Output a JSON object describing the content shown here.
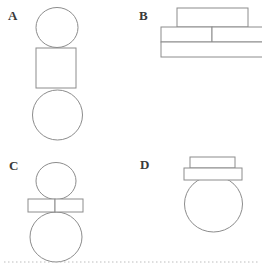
{
  "figure": {
    "background_color": "#ffffff",
    "stroke_color": "#8c8c8c",
    "fill_color": "#ffffff",
    "label_color": "#3a3a3a",
    "baseline_color": "#bdbdbd",
    "width": 262,
    "height": 267
  },
  "panels": [
    {
      "id": "panel-a",
      "label": "A",
      "label_x": 8,
      "label_y": 9,
      "description": "small circle above a square above a large circle",
      "shapes": [
        {
          "name": "small-circle",
          "type": "ellipse",
          "cx": 57,
          "cy": 27.5,
          "rx": 21,
          "ry": 20
        },
        {
          "name": "square",
          "type": "rect",
          "x": 36,
          "y": 48,
          "w": 40,
          "h": 40
        },
        {
          "name": "large-circle",
          "type": "ellipse",
          "cx": 57.5,
          "cy": 115,
          "rx": 25,
          "ry": 25
        }
      ]
    },
    {
      "id": "panel-b",
      "label": "B",
      "label_x": 139,
      "label_y": 9,
      "description": "narrow top bar over a split middle bar over a wide bottom bar",
      "shapes": [
        {
          "name": "top-bar",
          "type": "rect",
          "x": 177,
          "y": 8,
          "w": 71,
          "h": 19
        },
        {
          "name": "middle-bar-left",
          "type": "rect",
          "x": 161,
          "y": 27,
          "w": 51,
          "h": 15
        },
        {
          "name": "middle-bar-right",
          "type": "rect",
          "x": 212,
          "y": 27,
          "w": 53,
          "h": 15
        },
        {
          "name": "bottom-bar",
          "type": "rect",
          "x": 161,
          "y": 42,
          "w": 104,
          "h": 15
        }
      ]
    },
    {
      "id": "panel-c",
      "label": "C",
      "label_x": 9,
      "label_y": 159,
      "description": "small circle above two small bars above a large circle",
      "shapes": [
        {
          "name": "small-circle",
          "type": "ellipse",
          "cx": 56,
          "cy": 181,
          "rx": 20,
          "ry": 18.5
        },
        {
          "name": "bar-left",
          "type": "rect",
          "x": 28,
          "y": 199,
          "w": 27,
          "h": 13
        },
        {
          "name": "bar-right",
          "type": "rect",
          "x": 55,
          "y": 199,
          "w": 28,
          "h": 13
        },
        {
          "name": "large-circle",
          "type": "ellipse",
          "cx": 56,
          "cy": 237,
          "rx": 26,
          "ry": 25
        }
      ]
    },
    {
      "id": "panel-d",
      "label": "D",
      "label_x": 140,
      "label_y": 158,
      "description": "small bar over a wider bar over a large circle",
      "shapes": [
        {
          "name": "top-bar",
          "type": "rect",
          "x": 190,
          "y": 157,
          "w": 45,
          "h": 11
        },
        {
          "name": "wide-bar",
          "type": "rect",
          "x": 184,
          "y": 168,
          "w": 58,
          "h": 12
        },
        {
          "name": "large-circle",
          "type": "ellipse",
          "cx": 213.5,
          "cy": 204,
          "rx": 29,
          "ry": 28
        }
      ]
    }
  ],
  "baseline": {
    "name": "bottom-dotted-rule",
    "x1": 4,
    "y1": 262,
    "x2": 258,
    "y2": 262
  }
}
